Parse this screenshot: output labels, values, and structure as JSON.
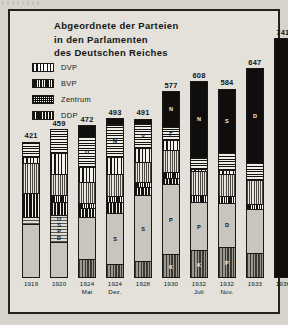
{
  "chart_data": {
    "type": "bar",
    "title": "Abgeordnete der Parteien in den Parlamenten des Deutschen Reiches",
    "title_lines": [
      "Abgeordnete der Parteien",
      "in den Parlamenten",
      "des Deutschen Reiches"
    ],
    "xlabel": "",
    "ylabel": "",
    "ylim": [
      0,
      741
    ],
    "grid": false,
    "legend_position": "upper-left",
    "categories": [
      "1919",
      "1920",
      "1924 Mai",
      "1924 Dez.",
      "1928",
      "1930",
      "1932 Juli",
      "1932 Nov.",
      "1933",
      "1936"
    ],
    "values": [
      421,
      459,
      472,
      493,
      491,
      577,
      608,
      584,
      647,
      741
    ],
    "tick_labels": [
      {
        "line1": "1919",
        "line2": ""
      },
      {
        "line1": "1920",
        "line2": ""
      },
      {
        "line1": "1924",
        "line2": "Mai"
      },
      {
        "line1": "1924",
        "line2": "Dez."
      },
      {
        "line1": "1928",
        "line2": ""
      },
      {
        "line1": "1930",
        "line2": ""
      },
      {
        "line1": "1932",
        "line2": "Juli"
      },
      {
        "line1": "1932",
        "line2": "Nov."
      },
      {
        "line1": "1933",
        "line2": ""
      },
      {
        "line1": "1936",
        "line2": ""
      }
    ],
    "legend": [
      {
        "label": "DVP",
        "pattern": "dvp"
      },
      {
        "label": "BVP",
        "pattern": "bvp"
      },
      {
        "label": "Zentrum",
        "pattern": "zentrum"
      },
      {
        "label": "DDP",
        "pattern": "ddp"
      }
    ],
    "series": [
      {
        "name": "NSDAP",
        "values": [
          0,
          0,
          32,
          14,
          12,
          107,
          230,
          196,
          288,
          741
        ]
      },
      {
        "name": "DNVP",
        "values": [
          44,
          71,
          95,
          103,
          73,
          41,
          37,
          52,
          52,
          0
        ]
      },
      {
        "name": "DVP",
        "values": [
          19,
          65,
          45,
          51,
          45,
          30,
          7,
          11,
          2,
          0
        ]
      },
      {
        "name": "DDP",
        "values": [
          75,
          39,
          28,
          32,
          25,
          20,
          4,
          2,
          5,
          0
        ]
      },
      {
        "name": "Zentrum",
        "values": [
          91,
          64,
          65,
          69,
          62,
          68,
          75,
          70,
          74,
          0
        ]
      },
      {
        "name": "BVP",
        "values": [
          0,
          21,
          16,
          19,
          16,
          19,
          22,
          20,
          18,
          0
        ]
      },
      {
        "name": "SPD",
        "values": [
          163,
          102,
          100,
          131,
          153,
          143,
          133,
          121,
          120,
          0
        ]
      },
      {
        "name": "USPD",
        "values": [
          22,
          84,
          0,
          0,
          0,
          0,
          0,
          0,
          0,
          0
        ]
      },
      {
        "name": "KPD",
        "values": [
          0,
          4,
          62,
          45,
          54,
          77,
          89,
          100,
          81,
          0
        ]
      },
      {
        "name": "Sonstige",
        "values": [
          7,
          9,
          29,
          29,
          51,
          72,
          11,
          12,
          7,
          0
        ]
      }
    ],
    "bars": [
      {
        "year": "1919",
        "total": 421,
        "segments": [
          {
            "party": "DNVP",
            "value": 44,
            "fill": "dnvp",
            "label": ""
          },
          {
            "party": "DVP",
            "value": 19,
            "fill": "dvp",
            "label": ""
          },
          {
            "party": "Zentrum",
            "value": 91,
            "fill": "zentrum",
            "label": ""
          },
          {
            "party": "DDP",
            "value": 75,
            "fill": "ddp",
            "label": ""
          },
          {
            "party": "USPD",
            "value": 22,
            "fill": "uspd",
            "label": ""
          },
          {
            "party": "SPD",
            "value": 170,
            "fill": "spd",
            "label": ""
          }
        ]
      },
      {
        "year": "1920",
        "total": 459,
        "segments": [
          {
            "party": "DNVP",
            "value": 71,
            "fill": "dnvp",
            "label": ""
          },
          {
            "party": "DVP",
            "value": 65,
            "fill": "dvp",
            "label": ""
          },
          {
            "party": "Zentrum",
            "value": 64,
            "fill": "zentrum",
            "label": ""
          },
          {
            "party": "BVP",
            "value": 21,
            "fill": "bvp",
            "label": ""
          },
          {
            "party": "DDP",
            "value": 39,
            "fill": "ddp",
            "label": ""
          },
          {
            "party": "USPD",
            "value": 84,
            "fill": "uspd",
            "label": "USPD"
          },
          {
            "party": "SPD",
            "value": 115,
            "fill": "spd",
            "label": ""
          }
        ]
      },
      {
        "year": "1924 Mai",
        "total": 472,
        "segments": [
          {
            "party": "NSDAP",
            "value": 32,
            "fill": "nsdap",
            "label": ""
          },
          {
            "party": "DNVP",
            "value": 95,
            "fill": "dnvp",
            "label": "D"
          },
          {
            "party": "DVP",
            "value": 45,
            "fill": "dvp",
            "label": ""
          },
          {
            "party": "Zentrum",
            "value": 65,
            "fill": "zentrum",
            "label": ""
          },
          {
            "party": "BVP",
            "value": 16,
            "fill": "bvp",
            "label": ""
          },
          {
            "party": "DDP",
            "value": 28,
            "fill": "ddp",
            "label": ""
          },
          {
            "party": "SPD",
            "value": 129,
            "fill": "spd",
            "label": ""
          },
          {
            "party": "KPD",
            "value": 62,
            "fill": "kpd",
            "label": ""
          }
        ]
      },
      {
        "year": "1924 Dez.",
        "total": 493,
        "segments": [
          {
            "party": "NSDAP",
            "value": 14,
            "fill": "nsdap",
            "label": ""
          },
          {
            "party": "DNVP",
            "value": 103,
            "fill": "dnvp",
            "label": "N"
          },
          {
            "party": "DVP",
            "value": 51,
            "fill": "dvp",
            "label": ""
          },
          {
            "party": "Zentrum",
            "value": 69,
            "fill": "zentrum",
            "label": ""
          },
          {
            "party": "BVP",
            "value": 19,
            "fill": "bvp",
            "label": ""
          },
          {
            "party": "DDP",
            "value": 32,
            "fill": "ddp",
            "label": ""
          },
          {
            "party": "SPD",
            "value": 160,
            "fill": "spd",
            "label": "S"
          },
          {
            "party": "KPD",
            "value": 45,
            "fill": "kpd",
            "label": ""
          }
        ]
      },
      {
        "year": "1928",
        "total": 491,
        "segments": [
          {
            "party": "NSDAP",
            "value": 12,
            "fill": "nsdap",
            "label": ""
          },
          {
            "party": "DNVP",
            "value": 73,
            "fill": "dnvp",
            "label": "V"
          },
          {
            "party": "DVP",
            "value": 45,
            "fill": "dvp",
            "label": ""
          },
          {
            "party": "Zentrum",
            "value": 62,
            "fill": "zentrum",
            "label": ""
          },
          {
            "party": "BVP",
            "value": 16,
            "fill": "bvp",
            "label": ""
          },
          {
            "party": "DDP",
            "value": 25,
            "fill": "ddp",
            "label": ""
          },
          {
            "party": "SPD",
            "value": 204,
            "fill": "spd",
            "label": "S"
          },
          {
            "party": "KPD",
            "value": 54,
            "fill": "kpd",
            "label": ""
          }
        ]
      },
      {
        "year": "1930",
        "total": 577,
        "segments": [
          {
            "party": "NSDAP",
            "value": 107,
            "fill": "nsdap",
            "label": "N"
          },
          {
            "party": "DNVP",
            "value": 41,
            "fill": "dnvp",
            "label": "F"
          },
          {
            "party": "DVP",
            "value": 30,
            "fill": "dvp",
            "label": ""
          },
          {
            "party": "Zentrum",
            "value": 68,
            "fill": "zentrum",
            "label": ""
          },
          {
            "party": "BVP",
            "value": 19,
            "fill": "bvp",
            "label": ""
          },
          {
            "party": "DDP",
            "value": 20,
            "fill": "ddp",
            "label": ""
          },
          {
            "party": "SPD",
            "value": 215,
            "fill": "spd",
            "label": "P"
          },
          {
            "party": "KPD",
            "value": 77,
            "fill": "kpd",
            "label": "K"
          }
        ]
      },
      {
        "year": "1932 Juli",
        "total": 608,
        "segments": [
          {
            "party": "NSDAP",
            "value": 230,
            "fill": "nsdap",
            "label": "N"
          },
          {
            "party": "DNVP",
            "value": 37,
            "fill": "dnvp",
            "label": ""
          },
          {
            "party": "DVP",
            "value": 7,
            "fill": "dvp",
            "label": ""
          },
          {
            "party": "Zentrum",
            "value": 75,
            "fill": "zentrum",
            "label": ""
          },
          {
            "party": "BVP",
            "value": 22,
            "fill": "bvp",
            "label": ""
          },
          {
            "party": "SPD",
            "value": 148,
            "fill": "spd",
            "label": "P"
          },
          {
            "party": "KPD",
            "value": 89,
            "fill": "kpd",
            "label": "K"
          }
        ]
      },
      {
        "year": "1932 Nov.",
        "total": 584,
        "segments": [
          {
            "party": "NSDAP",
            "value": 196,
            "fill": "nsdap",
            "label": "S"
          },
          {
            "party": "DNVP",
            "value": 52,
            "fill": "dnvp",
            "label": ""
          },
          {
            "party": "DVP",
            "value": 11,
            "fill": "dvp",
            "label": ""
          },
          {
            "party": "Zentrum",
            "value": 70,
            "fill": "zentrum",
            "label": ""
          },
          {
            "party": "BVP",
            "value": 20,
            "fill": "bvp",
            "label": ""
          },
          {
            "party": "SPD",
            "value": 135,
            "fill": "spd",
            "label": "D"
          },
          {
            "party": "KPD",
            "value": 100,
            "fill": "kpd",
            "label": "P"
          }
        ]
      },
      {
        "year": "1933",
        "total": 647,
        "segments": [
          {
            "party": "NSDAP",
            "value": 288,
            "fill": "nsdap",
            "label": "D"
          },
          {
            "party": "DNVP",
            "value": 52,
            "fill": "dnvp",
            "label": ""
          },
          {
            "party": "Zentrum",
            "value": 74,
            "fill": "zentrum",
            "label": ""
          },
          {
            "party": "BVP",
            "value": 18,
            "fill": "bvp",
            "label": ""
          },
          {
            "party": "SPD",
            "value": 134,
            "fill": "spd",
            "label": ""
          },
          {
            "party": "KPD",
            "value": 81,
            "fill": "kpd",
            "label": ""
          }
        ]
      },
      {
        "year": "1936",
        "total": 741,
        "segments": [
          {
            "party": "NSDAP",
            "value": 741,
            "fill": "nsdap-solid",
            "label": ""
          }
        ]
      }
    ]
  }
}
